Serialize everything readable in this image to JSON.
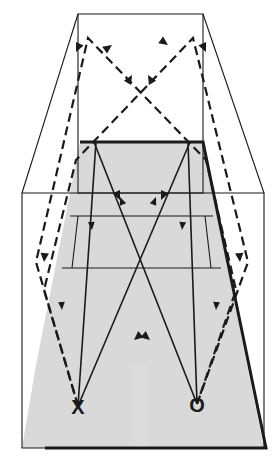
{
  "figure": {
    "type": "line-diagram",
    "width": 280,
    "height": 466,
    "background": "#ffffff",
    "line_color": "#1a1a1a",
    "shade_color": "#d9d9d9",
    "band_color": "#dcdcdc"
  },
  "labels": {
    "source_x": "X",
    "source_o": "O"
  },
  "chart_data": {
    "type": "line",
    "xlabel": "",
    "ylabel": "",
    "xlim": [
      0,
      280
    ],
    "ylim": [
      0,
      466
    ],
    "grid": false,
    "legend": "none",
    "annotations": [
      {
        "text": "X",
        "x": 78,
        "y": 406
      },
      {
        "text": "O",
        "x": 197,
        "y": 404
      }
    ],
    "series": [
      {
        "name": "outer-frame-rectangle",
        "style": "solid-thin",
        "closed": true,
        "points": [
          [
            22,
            193
          ],
          [
            264,
            193
          ],
          [
            264,
            448
          ],
          [
            22,
            448
          ]
        ]
      },
      {
        "name": "upper-box-rectangle",
        "style": "solid-thin",
        "closed": true,
        "points": [
          [
            78,
            14
          ],
          [
            203,
            14
          ],
          [
            203,
            193
          ],
          [
            78,
            193
          ]
        ]
      },
      {
        "name": "perspective-edge-top-left",
        "style": "solid-thin",
        "points": [
          [
            78,
            14
          ],
          [
            22,
            193
          ]
        ]
      },
      {
        "name": "perspective-edge-top-right",
        "style": "solid-thin",
        "points": [
          [
            203,
            14
          ],
          [
            264,
            193
          ]
        ]
      },
      {
        "name": "shaded-trapezoid",
        "style": "fill-shade",
        "closed": true,
        "points": [
          [
            80,
            142
          ],
          [
            203,
            142
          ],
          [
            247,
            365
          ],
          [
            36,
            365
          ]
        ]
      },
      {
        "name": "shaded-trapezoid-lower",
        "style": "fill-shade",
        "closed": true,
        "points": [
          [
            36,
            365
          ],
          [
            247,
            365
          ],
          [
            264,
            448
          ],
          [
            22,
            448
          ]
        ]
      },
      {
        "name": "trapezoid-outline-thick",
        "style": "solid-thick",
        "points": [
          [
            80,
            142
          ],
          [
            203,
            142
          ],
          [
            266,
            448
          ],
          [
            45,
            448
          ]
        ]
      },
      {
        "name": "band-line-upper",
        "style": "solid-thin",
        "points": [
          [
            70,
            216
          ],
          [
            213,
            216
          ]
        ]
      },
      {
        "name": "band-line-lower",
        "style": "solid-thin",
        "points": [
          [
            62,
            268
          ],
          [
            221,
            268
          ]
        ]
      },
      {
        "name": "inner-panel-left-vertical",
        "style": "solid-thin",
        "points": [
          [
            78,
            216
          ],
          [
            72,
            268
          ]
        ]
      },
      {
        "name": "inner-panel-right-vertical",
        "style": "solid-thin",
        "points": [
          [
            205,
            216
          ],
          [
            211,
            268
          ]
        ]
      },
      {
        "name": "solid-ray-left-down",
        "style": "solid-ray",
        "points": [
          [
            96,
            142
          ],
          [
            78,
            406
          ]
        ]
      },
      {
        "name": "solid-ray-right-down",
        "style": "solid-ray",
        "points": [
          [
            188,
            142
          ],
          [
            197,
            404
          ]
        ]
      },
      {
        "name": "solid-ray-up-left",
        "style": "solid-ray",
        "points": [
          [
            78,
            406
          ],
          [
            190,
            142
          ]
        ]
      },
      {
        "name": "solid-ray-up-right",
        "style": "solid-ray",
        "points": [
          [
            197,
            404
          ],
          [
            94,
            142
          ]
        ]
      },
      {
        "name": "dashed-ray-path-left",
        "style": "dashed-ray",
        "points": [
          [
            78,
            406
          ],
          [
            36,
            262
          ],
          [
            88,
            38
          ],
          [
            206,
            160
          ],
          [
            236,
            290
          ],
          [
            197,
            404
          ]
        ]
      },
      {
        "name": "dashed-ray-path-right",
        "style": "dashed-ray",
        "points": [
          [
            197,
            404
          ],
          [
            248,
            262
          ],
          [
            193,
            38
          ],
          [
            76,
            160
          ],
          [
            44,
            290
          ],
          [
            78,
            406
          ]
        ]
      },
      {
        "name": "gray-vertical-band",
        "style": "fill-band",
        "closed": true,
        "points": [
          [
            130,
            365
          ],
          [
            148,
            365
          ],
          [
            148,
            448
          ],
          [
            130,
            448
          ]
        ]
      }
    ],
    "arrow_markers": [
      {
        "x": 112,
        "y": 45,
        "angle": -35,
        "style": "dashed"
      },
      {
        "x": 168,
        "y": 45,
        "angle": 35,
        "style": "dashed"
      },
      {
        "x": 76,
        "y": 52,
        "angle": 115,
        "style": "dashed"
      },
      {
        "x": 206,
        "y": 52,
        "angle": 65,
        "style": "dashed"
      },
      {
        "x": 148,
        "y": 75,
        "angle": -120,
        "style": "dashed"
      },
      {
        "x": 132,
        "y": 75,
        "angle": -60,
        "style": "dashed"
      },
      {
        "x": 120,
        "y": 200,
        "angle": 65,
        "style": "dashed"
      },
      {
        "x": 161,
        "y": 200,
        "angle": 115,
        "style": "dashed"
      },
      {
        "x": 44,
        "y": 262,
        "angle": 95,
        "style": "dashed"
      },
      {
        "x": 240,
        "y": 262,
        "angle": 85,
        "style": "dashed"
      },
      {
        "x": 134,
        "y": 340,
        "angle": 140,
        "style": "dashed"
      },
      {
        "x": 150,
        "y": 340,
        "angle": 40,
        "style": "dashed"
      },
      {
        "x": 92,
        "y": 230,
        "angle": 85,
        "style": "solid"
      },
      {
        "x": 182,
        "y": 230,
        "angle": 95,
        "style": "solid"
      },
      {
        "x": 156,
        "y": 197,
        "angle": -68,
        "style": "solid"
      },
      {
        "x": 120,
        "y": 197,
        "angle": -112,
        "style": "solid"
      },
      {
        "x": 62,
        "y": 310,
        "angle": 86,
        "style": "solid"
      },
      {
        "x": 216,
        "y": 310,
        "angle": 94,
        "style": "solid"
      }
    ]
  }
}
